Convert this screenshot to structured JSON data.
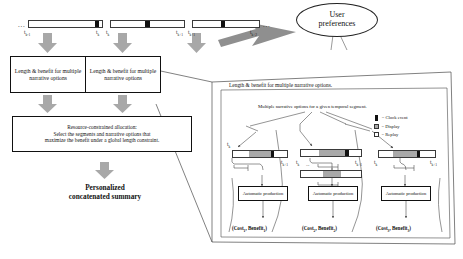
{
  "diagram": {
    "top_timelines": [
      {
        "id": "tl-1",
        "left_dots": "...",
        "ticks": [
          "t",
          "t"
        ],
        "tick_subs": [
          "k-1",
          "k"
        ],
        "segments": [
          {
            "type": "clock",
            "label": "clock-event"
          }
        ]
      },
      {
        "id": "tl-2",
        "ticks": [
          "",
          ""
        ],
        "tick_subs": [
          "",
          "k+1"
        ],
        "segments": [
          {
            "type": "clock",
            "label": "clock-event"
          }
        ]
      },
      {
        "id": "tl-3",
        "right_dots": "...",
        "ticks": [
          "t",
          "t"
        ],
        "tick_subs": [
          "k+1",
          "k+2"
        ],
        "segments": [
          {
            "type": "clock",
            "label": "clock-event"
          }
        ]
      }
    ],
    "length_benefit_boxes": [
      {
        "text": "Length & benefit for multiple narrative options"
      },
      {
        "text": "Length & benefit for multiple narrative options"
      }
    ],
    "allocation_box": {
      "line1": "Resource-constrained allocation:",
      "line2": "Select the segments and narrative options that",
      "line3": "maximize the benefit under a global length constraint."
    },
    "output_label": {
      "line1": "Personalized",
      "line2": "concatenated summary"
    },
    "user_preferences": {
      "line1": "User",
      "line2": "preferences"
    },
    "detail_panel": {
      "header": "Length & benefit for multiple narrative options.",
      "subheader": "Multiple narrative options for a given temporal segment.",
      "legend": [
        {
          "swatch": "clock",
          "label": "= Clock event",
          "color": "#111111"
        },
        {
          "swatch": "display",
          "label": "= Display",
          "color": "#a9a9a9"
        },
        {
          "swatch": "replay",
          "label": "= Replay",
          "color": "#ffffff"
        }
      ],
      "options": [
        {
          "tick_left": "t",
          "tick_left_sub": "k",
          "tick_right": "t",
          "tick_right_sub": "k+1",
          "production_box": "Automatic production",
          "cost_benefit": "(Cost",
          "cb_sub1": "1",
          "cb_mid": ", Benefit",
          "cb_sub2": "1",
          "cb_end": ")"
        },
        {
          "tick_left": "t",
          "tick_left_sub": "k",
          "tick_right": "t",
          "tick_right_sub": "k+1",
          "production_box": "Automatic production",
          "cost_benefit": "(Cost",
          "cb_sub1": "2",
          "cb_mid": ", Benefit",
          "cb_sub2": "2",
          "cb_end": ")"
        },
        {
          "tick_left": "t",
          "tick_left_sub": "k",
          "tick_right": "t",
          "tick_right_sub": "k+1",
          "production_box": "Automatic production",
          "cost_benefit": "(Cost",
          "cb_sub1": "3",
          "cb_mid": ", Benefit",
          "cb_sub2": "3",
          "cb_end": ")"
        }
      ],
      "ellipsis_marker": "..."
    },
    "colors": {
      "clock_event": "#111111",
      "display": "#a9a9a9",
      "replay": "#ffffff",
      "arrow_gray": "#a6a6a6",
      "arrow_dark_gray": "#808080",
      "outline": "#111111",
      "background": "#ffffff"
    }
  }
}
